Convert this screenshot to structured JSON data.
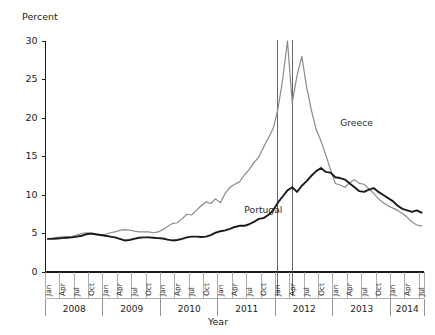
{
  "chart_data": {
    "type": "line",
    "title": "",
    "xlabel": "Year",
    "ylabel": "Percent",
    "ylim": [
      0,
      30
    ],
    "yticks": [
      0,
      5,
      10,
      15,
      20,
      25,
      30
    ],
    "grid": false,
    "legend_position": "inline-annotation",
    "x_tick_labels": [
      "Jan",
      "Apr",
      "Jul",
      "Oct"
    ],
    "years": [
      "2008",
      "2009",
      "2010",
      "2011",
      "2012",
      "2013",
      "2014"
    ],
    "x": [
      "2008-01",
      "2008-02",
      "2008-03",
      "2008-04",
      "2008-05",
      "2008-06",
      "2008-07",
      "2008-08",
      "2008-09",
      "2008-10",
      "2008-11",
      "2008-12",
      "2009-01",
      "2009-02",
      "2009-03",
      "2009-04",
      "2009-05",
      "2009-06",
      "2009-07",
      "2009-08",
      "2009-09",
      "2009-10",
      "2009-11",
      "2009-12",
      "2010-01",
      "2010-02",
      "2010-03",
      "2010-04",
      "2010-05",
      "2010-06",
      "2010-07",
      "2010-08",
      "2010-09",
      "2010-10",
      "2010-11",
      "2010-12",
      "2011-01",
      "2011-02",
      "2011-03",
      "2011-04",
      "2011-05",
      "2011-06",
      "2011-07",
      "2011-08",
      "2011-09",
      "2011-10",
      "2011-11",
      "2011-12",
      "2012-01",
      "2012-02",
      "2012-03",
      "2012-04",
      "2012-05",
      "2012-06",
      "2012-07",
      "2012-08",
      "2012-09",
      "2012-10",
      "2012-11",
      "2012-12",
      "2013-01",
      "2013-02",
      "2013-03",
      "2013-04",
      "2013-05",
      "2013-06",
      "2013-07",
      "2013-08",
      "2013-09",
      "2013-10",
      "2013-11",
      "2013-12",
      "2014-01",
      "2014-02",
      "2014-03",
      "2014-04",
      "2014-05",
      "2014-06",
      "2014-07"
    ],
    "series": [
      {
        "name": "Greece",
        "color": "#8a8a8a",
        "width": 1.2,
        "label_x": "2013-02",
        "label_y": 19.0,
        "values": [
          4.35,
          4.4,
          4.5,
          4.55,
          4.6,
          4.6,
          4.8,
          5.0,
          5.1,
          5.0,
          4.85,
          4.8,
          4.9,
          5.1,
          5.2,
          5.4,
          5.5,
          5.45,
          5.3,
          5.2,
          5.2,
          5.2,
          5.1,
          5.2,
          5.5,
          5.9,
          6.3,
          6.4,
          6.9,
          7.5,
          7.4,
          8.0,
          8.6,
          9.1,
          8.9,
          9.5,
          9.0,
          10.2,
          11.0,
          11.4,
          11.7,
          12.6,
          13.3,
          14.2,
          14.9,
          16.2,
          17.4,
          18.6,
          21.1,
          25.0,
          30.0,
          22.0,
          25.5,
          28.0,
          24.0,
          21.0,
          18.5,
          17.0,
          15.2,
          13.3,
          11.5,
          11.3,
          11.0,
          11.6,
          12.0,
          11.5,
          11.4,
          10.8,
          10.2,
          9.5,
          9.0,
          8.6,
          8.3,
          8.0,
          7.6,
          7.1,
          6.5,
          6.1,
          6.0
        ]
      },
      {
        "name": "Portugal",
        "color": "#1a1a1a",
        "width": 1.9,
        "label_x": "2011-06",
        "label_y": 7.7,
        "values": [
          4.3,
          4.3,
          4.35,
          4.4,
          4.45,
          4.5,
          4.6,
          4.7,
          4.9,
          5.0,
          4.9,
          4.8,
          4.7,
          4.6,
          4.5,
          4.3,
          4.1,
          4.15,
          4.3,
          4.45,
          4.5,
          4.5,
          4.45,
          4.4,
          4.35,
          4.2,
          4.1,
          4.15,
          4.3,
          4.5,
          4.6,
          4.6,
          4.55,
          4.6,
          4.8,
          5.1,
          5.3,
          5.4,
          5.6,
          5.85,
          6.0,
          6.0,
          6.2,
          6.5,
          6.9,
          7.0,
          7.4,
          8.0,
          9.0,
          9.8,
          10.6,
          11.0,
          10.4,
          11.2,
          11.8,
          12.5,
          13.1,
          13.5,
          13.0,
          12.9,
          12.3,
          12.2,
          12.0,
          11.5,
          11.0,
          10.5,
          10.4,
          10.7,
          10.9,
          10.4,
          10.0,
          9.6,
          9.2,
          8.6,
          8.2,
          8.0,
          7.8,
          8.0,
          7.7
        ]
      }
    ],
    "reference_lines": [
      {
        "name": "ref-line-jan-2012",
        "x": "2012-01"
      },
      {
        "name": "ref-line-apr-2012",
        "x": "2012-04"
      }
    ]
  }
}
